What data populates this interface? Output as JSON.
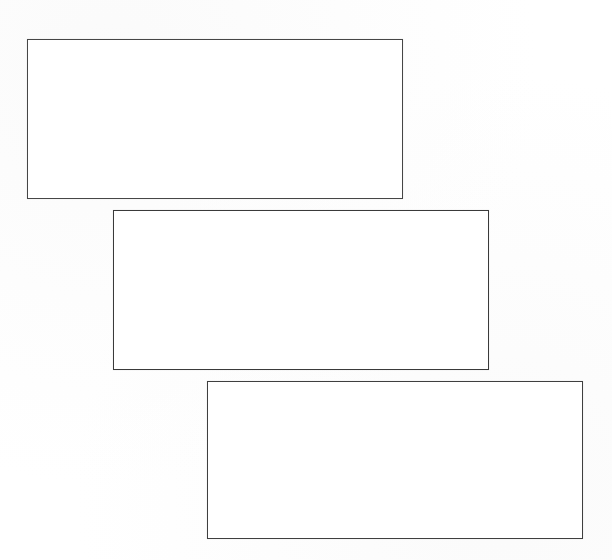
{
  "figure": {
    "canvas": {
      "width": 612,
      "height": 560,
      "background_color": "#ffffff",
      "paper_tone": "#fefefe"
    },
    "style": {
      "stroke_color": "#3c3c3c",
      "stroke_width_px": 1,
      "fill_color": "#ffffff",
      "fill": "none"
    },
    "shapes": [
      {
        "id": "box-1",
        "name": "rectangle-top-left",
        "label": "",
        "order": 1,
        "x": 27,
        "y": 39,
        "width": 376,
        "height": 160,
        "stroke_color": "#464646",
        "fill_color": "#ffffff",
        "content": ""
      },
      {
        "id": "box-2",
        "name": "rectangle-middle",
        "label": "",
        "order": 2,
        "x": 113,
        "y": 210,
        "width": 376,
        "height": 160,
        "stroke_color": "#3a3a3a",
        "fill_color": "#ffffff",
        "content": ""
      },
      {
        "id": "box-3",
        "name": "rectangle-bottom-right",
        "label": "",
        "order": 3,
        "x": 207,
        "y": 381,
        "width": 376,
        "height": 158,
        "stroke_color": "#3f3f3f",
        "fill_color": "#ffffff",
        "content": ""
      }
    ],
    "layout": {
      "arrangement": "cascade",
      "direction": "down-right",
      "horizontal_offset_px": 86,
      "vertical_offset_px": 171,
      "count": 3
    }
  }
}
